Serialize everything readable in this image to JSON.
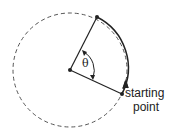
{
  "diagram": {
    "theta_label": "θ",
    "starting_label_line1": "starting",
    "starting_label_line2": "point",
    "colors": {
      "stroke": "#222222",
      "dashed": "#555555",
      "background": "#ffffff"
    }
  }
}
